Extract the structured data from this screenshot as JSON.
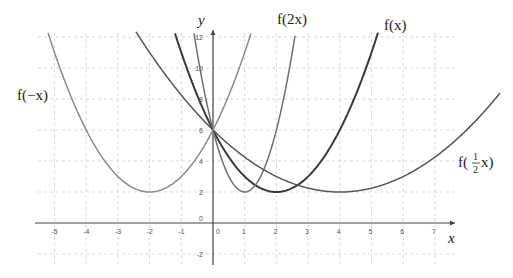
{
  "chart_data": {
    "type": "line",
    "title": "",
    "xlabel": "x",
    "ylabel": "y",
    "xlim": [
      -5.6,
      7.6
    ],
    "ylim": [
      -2.6,
      12.5
    ],
    "grid": true,
    "x_ticks": [
      -5,
      -4,
      -3,
      -2,
      -1,
      0,
      1,
      2,
      3,
      4,
      5,
      6,
      7
    ],
    "y_ticks": [
      -2,
      0,
      2,
      4,
      6,
      8,
      10,
      12
    ],
    "series": [
      {
        "name": "f(x)",
        "formula": "(x-2)^2+2",
        "vertex": [
          2,
          2
        ],
        "y_intercept": 6,
        "color": "#3a3a3a",
        "width": 2
      },
      {
        "name": "f(2x)",
        "formula": "(2x-2)^2+2",
        "vertex": [
          1,
          2
        ],
        "y_intercept": 6,
        "color": "#6e6e6e",
        "width": 1.5
      },
      {
        "name": "f(1/2 x)",
        "formula": "(x/2-2)^2+2",
        "vertex": [
          4,
          2
        ],
        "y_intercept": 6,
        "color": "#555555",
        "width": 1.5
      },
      {
        "name": "f(-x)",
        "formula": "(x+2)^2+2",
        "vertex": [
          -2,
          2
        ],
        "y_intercept": 6,
        "color": "#8a8a8a",
        "width": 1.5
      }
    ],
    "labels": {
      "f": "f(x)",
      "f2x": "f(2x)",
      "fneg": "f(−x)",
      "fhalf_prefix": "f(",
      "fhalf_num": "1",
      "fhalf_den": "2",
      "fhalf_suffix": "x)"
    }
  },
  "axes": {
    "x_label": "x",
    "y_label": "y"
  }
}
